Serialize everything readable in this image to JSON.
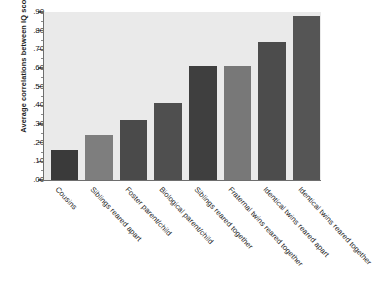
{
  "chart_data": {
    "type": "bar",
    "title": "",
    "xlabel": "",
    "ylabel": "Average correlations between IQ scores",
    "ylim": [
      0.0,
      0.9
    ],
    "ytick_labels": [
      ".90",
      ".80",
      ".70",
      ".60",
      ".50",
      ".40",
      ".30",
      ".20",
      ".10",
      ".00"
    ],
    "ytick_values": [
      0.9,
      0.8,
      0.7,
      0.6,
      0.5,
      0.4,
      0.3,
      0.2,
      0.1,
      0.0
    ],
    "minor_ticks": true,
    "grid": false,
    "legend": "none",
    "categories": [
      "Cousins",
      "Siblings reared apart",
      "Foster parent/child",
      "Biological parent/child",
      "Siblings reared together",
      "Fraternal twins reared together",
      "Identical twins reared apart",
      "Identical twins reared together"
    ],
    "values": [
      0.16,
      0.24,
      0.32,
      0.41,
      0.61,
      0.61,
      0.74,
      0.88
    ],
    "bar_colors": [
      "#3a3a3a",
      "#7e7e7e",
      "#4a4a4a",
      "#4f4f4f",
      "#3f3f3f",
      "#787878",
      "#4c4c4c",
      "#555555"
    ],
    "plot_background": "#eaeaea",
    "axis_color": "#6e6e6e",
    "figure_background": "#ffffff"
  }
}
